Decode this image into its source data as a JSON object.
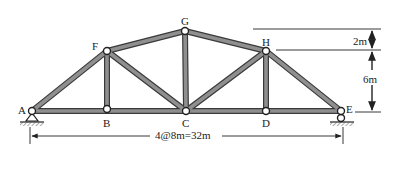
{
  "diagram": {
    "type": "roof-truss",
    "nodes": {
      "A": {
        "label": "A",
        "x": 32,
        "y": 111,
        "support": "pin"
      },
      "B": {
        "label": "B",
        "x": 107,
        "y": 111
      },
      "C": {
        "label": "C",
        "x": 186,
        "y": 111
      },
      "D": {
        "label": "D",
        "x": 266,
        "y": 111
      },
      "E": {
        "label": "E",
        "x": 341,
        "y": 111,
        "support": "roller"
      },
      "F": {
        "label": "F",
        "x": 107,
        "y": 51
      },
      "G": {
        "label": "G",
        "x": 185,
        "y": 31
      },
      "H": {
        "label": "H",
        "x": 266,
        "y": 51
      }
    },
    "members": [
      [
        "A",
        "B"
      ],
      [
        "B",
        "C"
      ],
      [
        "C",
        "D"
      ],
      [
        "D",
        "E"
      ],
      [
        "A",
        "F"
      ],
      [
        "F",
        "G"
      ],
      [
        "G",
        "H"
      ],
      [
        "H",
        "E"
      ],
      [
        "F",
        "B"
      ],
      [
        "F",
        "C"
      ],
      [
        "G",
        "C"
      ],
      [
        "H",
        "C"
      ],
      [
        "H",
        "D"
      ]
    ],
    "dimensions": {
      "span_label": "4@8m=32m",
      "upper_rise_label": "2m",
      "lower_rise_label": "6m"
    },
    "colors": {
      "member_fill": "#8a8a8a",
      "member_edge": "#3a3a3a",
      "joint_fill": "#ffffff",
      "line": "#222222"
    }
  }
}
